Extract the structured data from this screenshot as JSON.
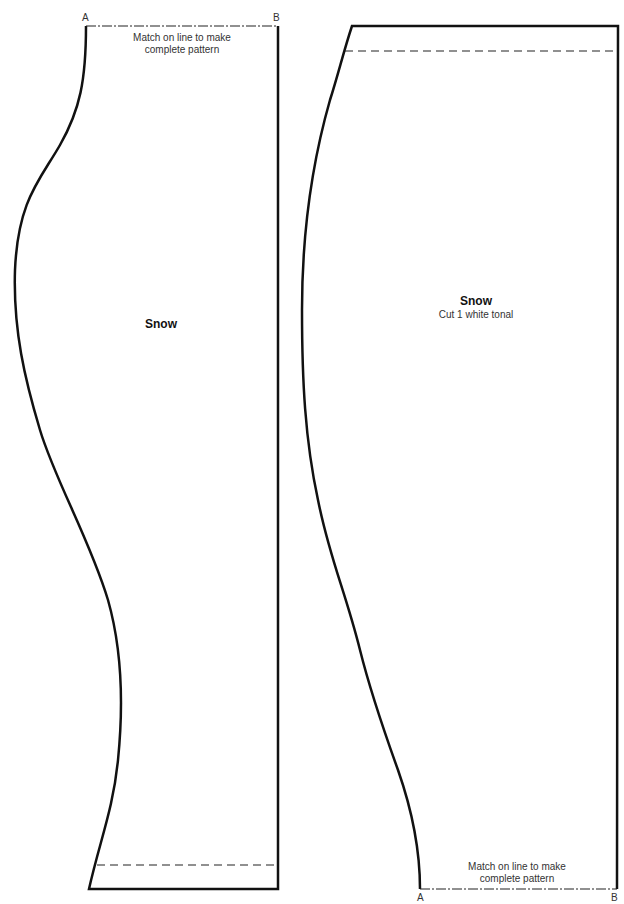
{
  "pieces": [
    {
      "id": "left",
      "title": "Snow",
      "subtitle": "",
      "match_note_line1": "Match on line to make",
      "match_note_line2": "complete pattern",
      "corner_a": "A",
      "corner_b": "B"
    },
    {
      "id": "right",
      "title": "Snow",
      "subtitle": "Cut 1 white tonal",
      "match_note_line1": "Match on line to make",
      "match_note_line2": "complete pattern",
      "corner_a": "A",
      "corner_b": "B"
    }
  ],
  "colors": {
    "outline": "#111111",
    "background": "#ffffff",
    "text": "#333333"
  }
}
